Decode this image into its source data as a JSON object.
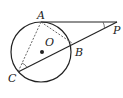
{
  "diagram": {
    "type": "geometry",
    "circle": {
      "center_label": "O",
      "cx": 41,
      "cy": 52,
      "r": 30
    },
    "points": {
      "A": {
        "label": "A",
        "x": 41,
        "y": 22
      },
      "B": {
        "label": "B",
        "x": 72,
        "y": 43
      },
      "C": {
        "label": "C",
        "x": 18,
        "y": 72
      },
      "P": {
        "label": "P",
        "x": 117,
        "y": 22
      },
      "O": {
        "label": "O",
        "x": 42,
        "y": 52
      }
    },
    "segments": [
      {
        "from": "A",
        "to": "P",
        "style": "solid"
      },
      {
        "from": "P",
        "to": "C",
        "style": "solid"
      },
      {
        "from": "A",
        "to": "B",
        "style": "dashed"
      },
      {
        "from": "A",
        "to": "C",
        "style": "dashed"
      }
    ],
    "angle_marks": [
      "P",
      "C"
    ],
    "stroke_color": "#222222"
  }
}
